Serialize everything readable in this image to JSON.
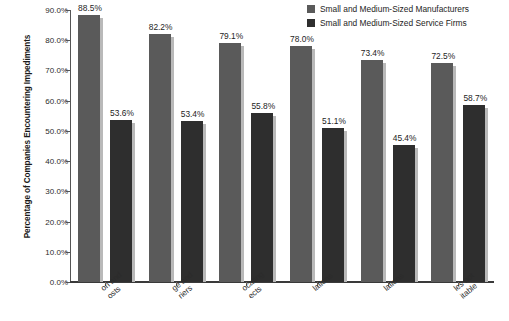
{
  "chart_data": {
    "type": "bar",
    "title": "",
    "subtitle": "",
    "xlabel": "",
    "ylabel": "Percentage of Companies Encountering Impediments",
    "ylim": [
      0,
      90
    ],
    "ytick_values": [
      0,
      10,
      20,
      30,
      40,
      50,
      60,
      70,
      80,
      90
    ],
    "ytick_labels": [
      "0.0%",
      "10.0%",
      "20.0%",
      "30.0%",
      "40.0%",
      "50.0%",
      "60.0%",
      "70.0%",
      "80.0%",
      "90.0%"
    ],
    "grid": false,
    "legend_position": "top-right",
    "categories": [
      "Transportation and logistics costs",
      "Language and cultural barriers",
      "Locating prospects",
      "Customs regulations",
      "Government regulations",
      "Sales not profitable"
    ],
    "category_labels_truncated": [
      [
        "on and",
        "osts"
      ],
      [
        "ge and",
        "riers"
      ],
      [
        "ocating",
        "ects"
      ],
      [
        "lations",
        ""
      ],
      [
        "lations",
        ""
      ],
      [
        "les not",
        "itable"
      ]
    ],
    "series": [
      {
        "name": "Small and Medium-Sized Manufacturers",
        "color": "#5a5a5a",
        "values": [
          88.5,
          82.2,
          79.1,
          78.0,
          73.4,
          72.5
        ],
        "data_labels": [
          "88.5%",
          "82.2%",
          "79.1%",
          "78.0%",
          "73.4%",
          "72.5%"
        ]
      },
      {
        "name": "Small and Medium-Sized Service Firms",
        "color": "#2e2e2e",
        "values": [
          53.6,
          53.4,
          55.8,
          51.1,
          45.4,
          58.7
        ],
        "data_labels": [
          "53.6%",
          "53.4%",
          "55.8%",
          "51.1%",
          "45.4%",
          "58.7%"
        ]
      }
    ]
  }
}
